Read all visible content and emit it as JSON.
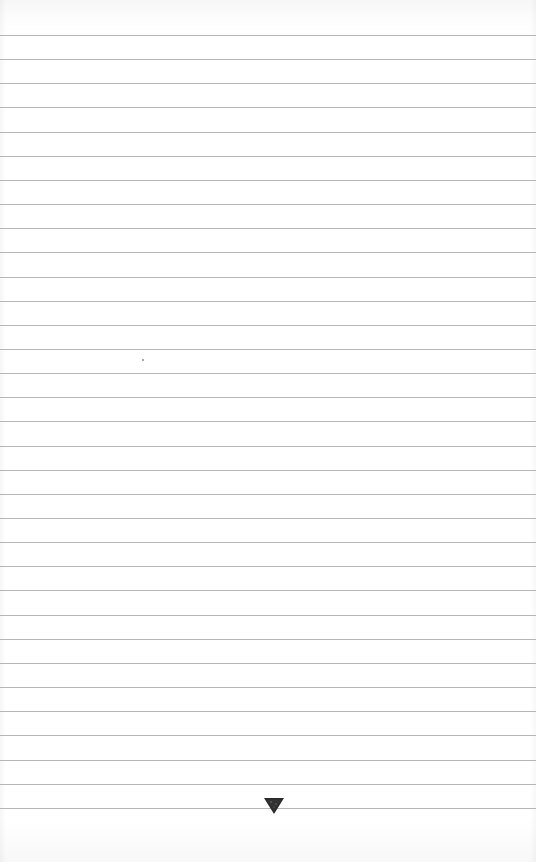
{
  "page": {
    "type": "lined-paper",
    "background_color": "#ffffff",
    "rule_color": "#a9a9a9",
    "rule_count": 33,
    "rule_first_y": 35,
    "rule_spacing": 24.15
  },
  "emblem": {
    "icon": "down-triangle-icon",
    "color": "#2a2a2a"
  }
}
